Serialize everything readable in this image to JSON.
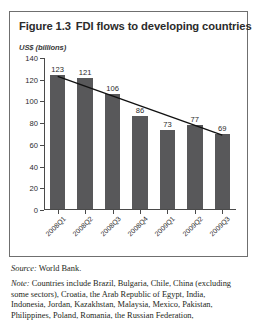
{
  "figure": {
    "number": "Figure 1.3",
    "title": "FDI flows to developing countries",
    "source_lead": "Source:",
    "source_text": "World Bank.",
    "note_lead": "Note:",
    "note_lines": [
      "Countries include Brazil, Bulgaria, Chile, China (excluding",
      "some sectors), Croatia, the Arab Republic of Egypt, India,",
      "Indonesia, Jordan, Kazakhstan, Malaysia, Mexico, Pakistan,",
      "Philippines, Poland, Romania, the Russian Federation,"
    ]
  },
  "chart_data": {
    "type": "bar",
    "title": "FDI flows to developing countries",
    "subtitle": "",
    "xlabel": "",
    "ylabel": "US$ (billions)",
    "categories": [
      "2008Q1",
      "2008Q2",
      "2008Q3",
      "2008Q4",
      "2009Q1",
      "2009Q2",
      "2009Q3"
    ],
    "values": [
      123,
      121,
      106,
      86,
      73,
      77,
      69
    ],
    "ylim": [
      0,
      140
    ],
    "yticks": [
      0,
      20,
      40,
      60,
      80,
      100,
      120,
      140
    ],
    "grid": false,
    "legend": "none",
    "bar_color": "#58585a",
    "trendline": {
      "type": "linear",
      "color": "#111111",
      "start_value": 123,
      "end_value": 69
    }
  }
}
